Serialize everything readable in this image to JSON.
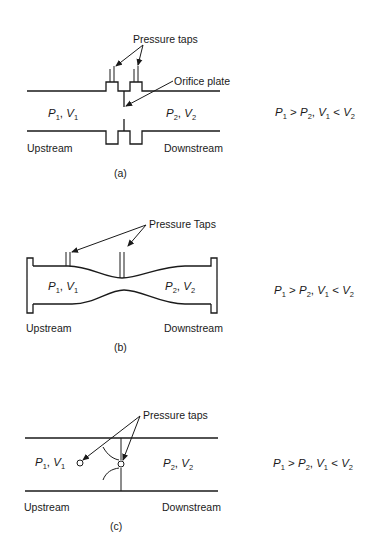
{
  "figure": {
    "panels": [
      {
        "id": "a",
        "caption": "(a)",
        "device": "orifice plate",
        "callouts": {
          "taps": "Pressure taps",
          "plate": "Orifice plate"
        },
        "upstream_state": {
          "p": "P",
          "p_sub": "1",
          "sep": ", ",
          "v": "V",
          "v_sub": "1"
        },
        "downstream_state": {
          "p": "P",
          "p_sub": "2",
          "sep": ", ",
          "v": "V",
          "v_sub": "2"
        },
        "upstream_label": "Upstream",
        "downstream_label": "Downstream",
        "relation": {
          "p1": "P",
          "p1_sub": "1",
          "gt": " > ",
          "p2": "P",
          "p2_sub": "2",
          "sep": ", ",
          "v1": "V",
          "v1_sub": "1",
          "lt": " < ",
          "v2": "V",
          "v2_sub": "2"
        }
      },
      {
        "id": "b",
        "caption": "(b)",
        "device": "venturi",
        "callouts": {
          "taps": "Pressure Taps"
        },
        "upstream_state": {
          "p": "P",
          "p_sub": "1",
          "sep": ", ",
          "v": "V",
          "v_sub": "1"
        },
        "downstream_state": {
          "p": "P",
          "p_sub": "2",
          "sep": ", ",
          "v": "V",
          "v_sub": "2"
        },
        "upstream_label": "Upstream",
        "downstream_label": "Downstream",
        "relation": {
          "p1": "P",
          "p1_sub": "1",
          "gt": " > ",
          "p2": "P",
          "p2_sub": "2",
          "sep": ", ",
          "v1": "V",
          "v1_sub": "1",
          "lt": " < ",
          "v2": "V",
          "v2_sub": "2"
        }
      },
      {
        "id": "c",
        "caption": "(c)",
        "device": "flow nozzle",
        "callouts": {
          "taps": "Pressure taps"
        },
        "upstream_state": {
          "p": "P",
          "p_sub": "1",
          "sep": ", ",
          "v": "V",
          "v_sub": "1"
        },
        "downstream_state": {
          "p": "P",
          "p_sub": "2",
          "sep": ", ",
          "v": "V",
          "v_sub": "2"
        },
        "upstream_label": "Upstream",
        "downstream_label": "Downstream",
        "relation": {
          "p1": "P",
          "p1_sub": "1",
          "gt": " > ",
          "p2": "P",
          "p2_sub": "2",
          "sep": ", ",
          "v1": "V",
          "v1_sub": "1",
          "lt": " < ",
          "v2": "V",
          "v2_sub": "2"
        }
      }
    ]
  }
}
